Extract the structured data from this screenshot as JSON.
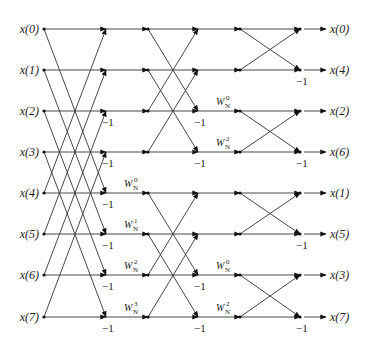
{
  "diagram": {
    "inputs": [
      "x(0)",
      "x(1)",
      "x(2)",
      "x(3)",
      "x(4)",
      "x(5)",
      "x(6)",
      "x(7)"
    ],
    "outputs": [
      "x(0)",
      "x(4)",
      "x(2)",
      "x(6)",
      "x(1)",
      "x(5)",
      "x(3)",
      "x(7)"
    ],
    "rows_y": [
      29,
      70,
      111,
      152,
      193,
      234,
      275,
      317
    ],
    "columns_x": {
      "input": 44,
      "s1": 106,
      "s1out": 148,
      "s2": 198,
      "s2out": 240,
      "s3": 300,
      "out": 322
    },
    "stage1": {
      "pairs": [
        [
          0,
          4
        ],
        [
          1,
          5
        ],
        [
          2,
          6
        ],
        [
          3,
          7
        ]
      ],
      "twiddles": [
        {
          "row": 4,
          "label": "W",
          "sub": "N",
          "sup": "0"
        },
        {
          "row": 5,
          "label": "W",
          "sub": "N",
          "sup": "1"
        },
        {
          "row": 6,
          "label": "W",
          "sub": "N",
          "sup": "2"
        },
        {
          "row": 7,
          "label": "W",
          "sub": "N",
          "sup": "3"
        }
      ],
      "minus_one_rows": [
        2,
        3,
        4,
        5,
        6,
        7
      ]
    },
    "stage2": {
      "pairs": [
        [
          0,
          2
        ],
        [
          1,
          3
        ],
        [
          4,
          6
        ],
        [
          5,
          7
        ]
      ],
      "twiddles": [
        {
          "row": 2,
          "label": "W",
          "sub": "N",
          "sup": "0"
        },
        {
          "row": 3,
          "label": "W",
          "sub": "N",
          "sup": "2"
        },
        {
          "row": 6,
          "label": "W",
          "sub": "N",
          "sup": "0"
        },
        {
          "row": 7,
          "label": "W",
          "sub": "N",
          "sup": "2"
        }
      ],
      "minus_one_rows": [
        2,
        3,
        6,
        7
      ]
    },
    "stage3": {
      "pairs": [
        [
          0,
          1
        ],
        [
          2,
          3
        ],
        [
          4,
          5
        ],
        [
          6,
          7
        ]
      ],
      "minus_one_rows": [
        1,
        3,
        5,
        7
      ]
    },
    "minus_one_label": "−1"
  }
}
